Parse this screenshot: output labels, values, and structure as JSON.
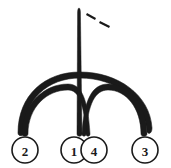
{
  "diagram": {
    "title": "",
    "background_color": "#ffffff",
    "stroke_color": "#1a1a1a",
    "nodes": [
      {
        "id": "2",
        "label": "2",
        "cx": 25,
        "cy": 150,
        "r": 13
      },
      {
        "id": "1",
        "label": "1",
        "cx": 74,
        "cy": 150,
        "r": 13
      },
      {
        "id": "4",
        "label": "4",
        "cx": 94,
        "cy": 150,
        "r": 13
      },
      {
        "id": "3",
        "label": "3",
        "cx": 145,
        "cy": 150,
        "r": 13
      }
    ],
    "edges": [
      {
        "id": "arc-2-3",
        "from": "2",
        "to": "3",
        "kind": "outer-arc"
      },
      {
        "id": "arc-2-1",
        "from": "2",
        "to": "1",
        "kind": "inner-arc"
      },
      {
        "id": "arc-4-3",
        "from": "4",
        "to": "3",
        "kind": "inner-arc"
      },
      {
        "id": "spike-1",
        "from": "1",
        "to": "apex",
        "kind": "spike"
      },
      {
        "id": "dash-apex",
        "from": "apex",
        "to": "open",
        "kind": "dashed-ray"
      }
    ],
    "apex": {
      "x": 79,
      "y": 8
    },
    "dashes": [
      {
        "x1": 88,
        "y1": 14,
        "x2": 95,
        "y2": 18
      },
      {
        "x1": 100,
        "y1": 21,
        "x2": 108,
        "y2": 25
      }
    ]
  }
}
